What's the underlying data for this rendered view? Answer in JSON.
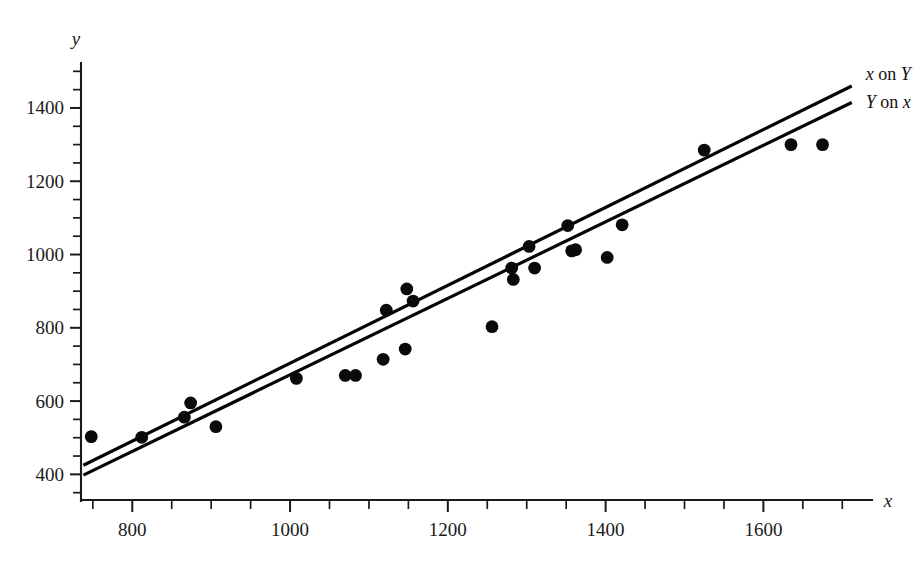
{
  "chart_data": {
    "type": "scatter",
    "title": "",
    "xlabel": "x",
    "ylabel": "y",
    "xlim": [
      735,
      1725
    ],
    "ylim": [
      330,
      1520
    ],
    "grid": false,
    "legend_position": "right-end-of-lines",
    "x_ticks_major": [
      800,
      1000,
      1200,
      1400,
      1600
    ],
    "x_ticks_major_labels": [
      "800",
      "1000",
      "1200",
      "1400",
      "1600"
    ],
    "x_tick_minor_step": 50,
    "y_ticks_major": [
      400,
      600,
      800,
      1000,
      1200,
      1400
    ],
    "y_ticks_major_labels": [
      "400",
      "600",
      "800",
      "1000",
      "1200",
      "1400"
    ],
    "y_tick_minor_step": 50,
    "marker": "filled-circle",
    "marker_color": "#0a0a0a",
    "points": [
      [
        748,
        503
      ],
      [
        812,
        501
      ],
      [
        866,
        556
      ],
      [
        874,
        595
      ],
      [
        906,
        530
      ],
      [
        1008,
        662
      ],
      [
        1070,
        670
      ],
      [
        1083,
        670
      ],
      [
        1118,
        714
      ],
      [
        1122,
        848
      ],
      [
        1146,
        742
      ],
      [
        1148,
        906
      ],
      [
        1156,
        873
      ],
      [
        1256,
        803
      ],
      [
        1281,
        963
      ],
      [
        1283,
        932
      ],
      [
        1303,
        1022
      ],
      [
        1310,
        963
      ],
      [
        1352,
        1079
      ],
      [
        1357,
        1010
      ],
      [
        1362,
        1013
      ],
      [
        1402,
        992
      ],
      [
        1421,
        1081
      ],
      [
        1525,
        1285
      ],
      [
        1635,
        1300
      ],
      [
        1675,
        1300
      ]
    ],
    "series": [
      {
        "name": "x on Y",
        "label": "x on Y",
        "label_parts": [
          {
            "text": "x",
            "italic": true
          },
          {
            "text": " on ",
            "italic": false
          },
          {
            "text": "Y",
            "italic": true
          }
        ],
        "type": "line",
        "color": "#050505",
        "endpoints": [
          [
            738,
            425
          ],
          [
            1712,
            1460
          ]
        ]
      },
      {
        "name": "Y on x",
        "label": "Y on x",
        "label_parts": [
          {
            "text": "Y",
            "italic": true
          },
          {
            "text": " on ",
            "italic": false
          },
          {
            "text": "x",
            "italic": true
          }
        ],
        "type": "line",
        "color": "#050505",
        "endpoints": [
          [
            738,
            398
          ],
          [
            1712,
            1415
          ]
        ]
      }
    ]
  },
  "axes": {
    "x_axis_label": "x",
    "y_axis_label": "y"
  },
  "caption": {
    "text": ""
  }
}
